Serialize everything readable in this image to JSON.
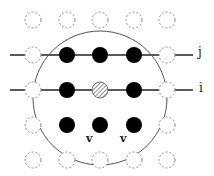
{
  "diagram": {
    "grid": {
      "columns_x": [
        33,
        67,
        100,
        134,
        167
      ],
      "rows_y": [
        20,
        55,
        90,
        125,
        160
      ],
      "node_radius": 8
    },
    "nodes": [
      {
        "row": 0,
        "col": 0,
        "style": "dashed"
      },
      {
        "row": 0,
        "col": 1,
        "style": "dashed"
      },
      {
        "row": 0,
        "col": 2,
        "style": "dashed"
      },
      {
        "row": 0,
        "col": 3,
        "style": "dashed"
      },
      {
        "row": 0,
        "col": 4,
        "style": "dashed"
      },
      {
        "row": 1,
        "col": 0,
        "style": "dashed"
      },
      {
        "row": 1,
        "col": 1,
        "style": "filled"
      },
      {
        "row": 1,
        "col": 2,
        "style": "filled"
      },
      {
        "row": 1,
        "col": 3,
        "style": "filled"
      },
      {
        "row": 1,
        "col": 4,
        "style": "dashed"
      },
      {
        "row": 2,
        "col": 0,
        "style": "dashed"
      },
      {
        "row": 2,
        "col": 1,
        "style": "filled"
      },
      {
        "row": 2,
        "col": 2,
        "style": "hatched"
      },
      {
        "row": 2,
        "col": 3,
        "style": "filled"
      },
      {
        "row": 2,
        "col": 4,
        "style": "dashed"
      },
      {
        "row": 3,
        "col": 0,
        "style": "dashed"
      },
      {
        "row": 3,
        "col": 1,
        "style": "filled"
      },
      {
        "row": 3,
        "col": 2,
        "style": "filled"
      },
      {
        "row": 3,
        "col": 3,
        "style": "filled"
      },
      {
        "row": 3,
        "col": 4,
        "style": "dashed"
      },
      {
        "row": 4,
        "col": 0,
        "style": "dashed"
      },
      {
        "row": 4,
        "col": 1,
        "style": "dashed"
      },
      {
        "row": 4,
        "col": 2,
        "style": "dashed"
      },
      {
        "row": 4,
        "col": 3,
        "style": "dashed"
      },
      {
        "row": 4,
        "col": 4,
        "style": "dashed"
      }
    ],
    "lines": [
      {
        "name": "line-j",
        "y": 55,
        "x1": 10,
        "x2": 193
      },
      {
        "name": "line-i",
        "y": 90,
        "x1": 10,
        "x2": 193
      }
    ],
    "neighborhood_circle": {
      "cx": 100,
      "cy": 98,
      "r": 67
    },
    "labels": {
      "j": "j",
      "i": "i",
      "v1": "v",
      "v2": "v"
    },
    "colors": {
      "filled": "#000000",
      "dashed": "#888888",
      "line": "#222222",
      "circle": "#555555"
    }
  }
}
